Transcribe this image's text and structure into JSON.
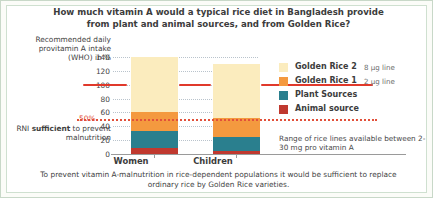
{
  "title": "How much vitamin A would a typical rice diet in Bangladesh provide from plant and animal sources, and from Golden Rice?",
  "axis_caption": "Recommended daily provitamin A intake (WHO) in %",
  "rni_note_prefix": "RNI ",
  "rni_note_bold": "sufficient",
  "rni_note_suffix": " to prevent malnutrition",
  "marker_50": "50%",
  "footer": "To prevent vitamin A-malnutrition in rice-dependent populations it would be sufficient to replace ordinary rice by Golden Rice varieties.",
  "legend": {
    "items": [
      {
        "label": "Golden Rice 2",
        "sub": "8 µg line",
        "color": "#fbecbe"
      },
      {
        "label": "Golden Rice 1",
        "sub": "2 µg line",
        "color": "#f4993f"
      },
      {
        "label": "Plant Sources",
        "sub": "",
        "color": "#2a7f8e"
      },
      {
        "label": "Animal source",
        "sub": "",
        "color": "#c0392f"
      }
    ],
    "note": "Range of rice lines available between 2-30 mg pro vitamin A"
  },
  "chart_data": {
    "type": "bar",
    "subtype": "stacked",
    "title": "How much vitamin A would a typical rice diet in Bangladesh provide from plant and animal sources, and from Golden Rice?",
    "xlabel": "",
    "ylabel": "Recommended daily provitamin A intake (WHO) in %",
    "categories": [
      "Women",
      "Children"
    ],
    "ylim": [
      0,
      140
    ],
    "yticks": [
      0,
      20,
      40,
      60,
      80,
      100,
      120,
      140
    ],
    "ytick_labels": [
      "0",
      "20",
      "40",
      "60",
      "80",
      "100",
      "120",
      "140"
    ],
    "grid": true,
    "legend_position": "right",
    "series": [
      {
        "name": "Animal source",
        "color": "#c0392f",
        "values": [
          8,
          5
        ]
      },
      {
        "name": "Plant Sources",
        "color": "#2a7f8e",
        "values": [
          25,
          20
        ]
      },
      {
        "name": "Golden Rice 1",
        "color": "#f4993f",
        "values": [
          27,
          27
        ]
      },
      {
        "name": "Golden Rice 2",
        "color": "#fbecbe",
        "values": [
          80,
          78
        ]
      }
    ],
    "totals": [
      140,
      130
    ],
    "annotations": [
      {
        "label": "50%",
        "value": 50,
        "style": "dotted",
        "color": "#e2503a",
        "text": "RNI sufficient to prevent malnutrition"
      },
      {
        "label": "100%",
        "value": 100,
        "style": "solid",
        "color": "#e0392b",
        "text": "Recommended daily intake"
      }
    ]
  }
}
